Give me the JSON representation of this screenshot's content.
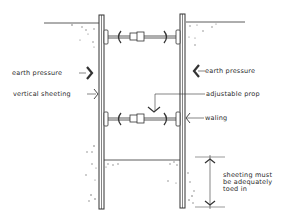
{
  "diagram": {
    "title": "",
    "colors": {
      "ink": "#333333",
      "soil_dots": "#777777",
      "background": "#ffffff"
    },
    "labels": {
      "earth_pressure_left": "earth pressure",
      "vertical_sheeting": "vertical sheeting",
      "earth_pressure_right": "earth pressure",
      "adjustable_prop": "adjustable prop",
      "waling": "waling",
      "toe_note": "sheeting must be adequately toed in"
    },
    "components": [
      {
        "name": "left vertical sheeting",
        "type": "sheet pile"
      },
      {
        "name": "right vertical sheeting",
        "type": "sheet pile"
      },
      {
        "name": "upper adjustable prop",
        "type": "strut",
        "with": "walings both ends"
      },
      {
        "name": "lower adjustable prop",
        "type": "strut",
        "with": "walings both ends"
      },
      {
        "name": "ground level left",
        "type": "line"
      },
      {
        "name": "ground level right",
        "type": "line"
      },
      {
        "name": "excavation base",
        "type": "line"
      },
      {
        "name": "toe-in dimension",
        "type": "dimension arrow"
      }
    ]
  }
}
